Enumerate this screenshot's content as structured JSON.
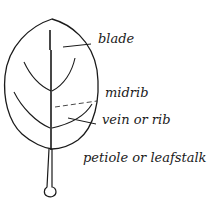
{
  "diagram": {
    "subject": "leaf",
    "stroke_color": "#1a1a1a",
    "background": "#ffffff",
    "labels": {
      "blade": "blade",
      "midrib": "midrib",
      "vein": "vein or rib",
      "petiole": "petiole or leafstalk"
    }
  }
}
